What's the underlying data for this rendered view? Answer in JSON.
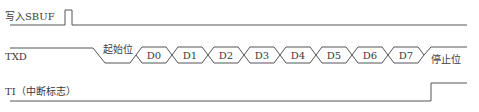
{
  "diagram": {
    "type": "timing-diagram",
    "signals": [
      {
        "id": "sbuf",
        "label": "写入SBUF"
      },
      {
        "id": "txd",
        "label": "TXD"
      },
      {
        "id": "ti",
        "label": "TI（中断标志）"
      }
    ],
    "txd": {
      "start_bit_label": "起始位",
      "data_bits": [
        "D0",
        "D1",
        "D2",
        "D3",
        "D4",
        "D5",
        "D6",
        "D7"
      ],
      "stop_bit_label": "停止位"
    },
    "colors": {
      "line": "#555555",
      "text": "#3a3a3a",
      "background": "#ffffff"
    }
  }
}
